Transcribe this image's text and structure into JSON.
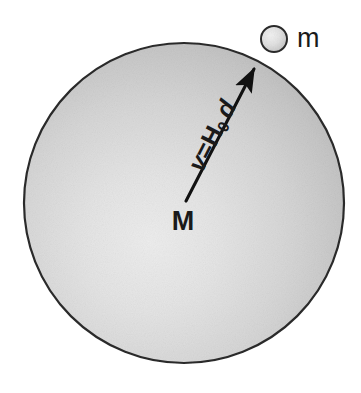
{
  "figure": {
    "background_color": "#ffffff",
    "width": 361,
    "height": 393
  },
  "large_sphere": {
    "name": "large-sphere",
    "label": "M",
    "label_meaning": "mass of sphere",
    "center_x": 184,
    "center_y": 203,
    "radius": 160,
    "fill_center_color": "#e8e8e8",
    "fill_edge_color": "#b0b0b0",
    "outline_color": "#2b2b2b",
    "highlight_x": 150,
    "highlight_y": 243
  },
  "small_sphere": {
    "name": "small-sphere",
    "label": "m",
    "label_meaning": "test particle mass",
    "center_x": 274,
    "center_y": 39,
    "radius": 13,
    "fill_center_color": "#eeeeee",
    "fill_edge_color": "#c0c0c0",
    "outline_color": "#2b2b2b"
  },
  "velocity_arrow": {
    "name": "velocity-arrow",
    "tail_x": 186,
    "tail_y": 201,
    "head_x": 256,
    "head_y": 65,
    "color": "#111111",
    "label_parts": {
      "v": "v",
      "equals": "=",
      "H": "H",
      "subscript": "0",
      "d": "d"
    },
    "label_plain": "v=H₀ d",
    "label_rotation_deg": -62.8
  },
  "colors": {
    "ink": "#1a1a1a",
    "sphere_light": "#e8e8e8",
    "sphere_dark": "#b0b0b0",
    "outline": "#2b2b2b",
    "background": "#ffffff"
  }
}
